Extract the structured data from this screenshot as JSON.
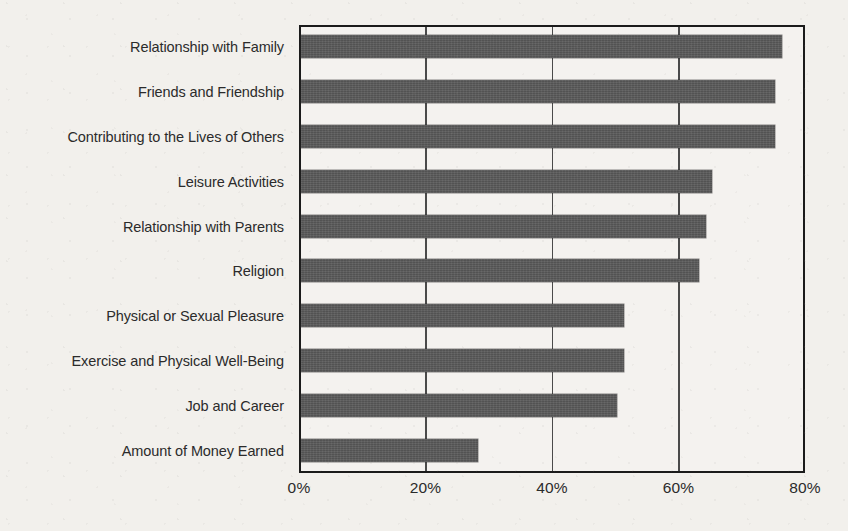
{
  "chart_data": {
    "type": "bar",
    "orientation": "horizontal",
    "title": "",
    "xlabel": "",
    "ylabel": "",
    "xlim": [
      0,
      80
    ],
    "grid": true,
    "legend": "none",
    "xticks": [
      "0%",
      "20%",
      "40%",
      "60%",
      "80%"
    ],
    "xtick_values": [
      0,
      20,
      40,
      60,
      80
    ],
    "categories": [
      "Relationship with Family",
      "Friends and Friendship",
      "Contributing to the Lives of Others",
      "Leisure Activities",
      "Relationship with Parents",
      "Religion",
      "Physical or Sexual Pleasure",
      "Exercise and Physical Well-Being",
      "Job and Career",
      "Amount of Money Earned"
    ],
    "values": [
      76,
      75,
      75,
      65,
      64,
      63,
      51,
      51,
      50,
      28
    ],
    "value_unit": "%",
    "bar_color": "#5a5a5a",
    "axis_color": "#1b1b1b",
    "background_color": "#f2f0ec"
  },
  "plot": {
    "top_strip_text": ""
  }
}
